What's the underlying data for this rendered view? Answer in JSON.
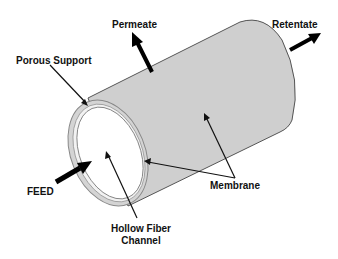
{
  "diagram": {
    "labels": {
      "permeate": "Permeate",
      "retentate": "Retentate",
      "porous_support": "Porous Support",
      "feed": "FEED",
      "membrane": "Membrane",
      "hollow_fiber_line1": "Hollow Fiber",
      "hollow_fiber_line2": "Channel"
    },
    "colors": {
      "cylinder_fill": "#cfcfcf",
      "outline": "#555555",
      "arrow": "#000000",
      "text": "#111111",
      "ring": "#bdbdbd"
    }
  }
}
